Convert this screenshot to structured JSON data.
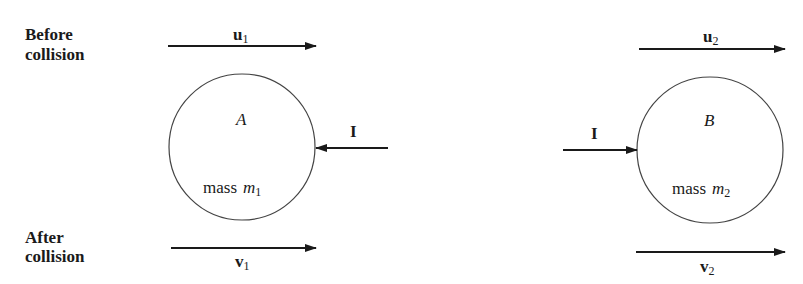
{
  "labels": {
    "before_line1": "Before",
    "before_line2": "collision",
    "after_line1": "After",
    "after_line2": "collision"
  },
  "body_a": {
    "name": "A",
    "mass_word": "mass",
    "mass_symbol": "m",
    "mass_subscript": "1",
    "velocity_before": {
      "symbol": "u",
      "subscript": "1"
    },
    "velocity_after": {
      "symbol": "v",
      "subscript": "1"
    },
    "impulse": "I"
  },
  "body_b": {
    "name": "B",
    "mass_word": "mass",
    "mass_symbol": "m",
    "mass_subscript": "2",
    "velocity_before": {
      "symbol": "u",
      "subscript": "2"
    },
    "velocity_after": {
      "symbol": "v",
      "subscript": "2"
    },
    "impulse": "I"
  },
  "colors": {
    "stroke": "#1a1a1a",
    "circle": "#444444",
    "background": "#ffffff"
  }
}
